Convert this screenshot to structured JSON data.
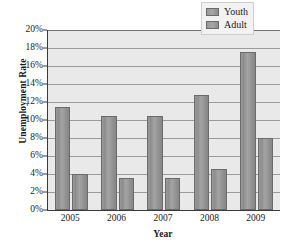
{
  "chart_data": {
    "type": "bar",
    "title": "",
    "xlabel": "Year",
    "ylabel": "Unemployment Rate",
    "categories": [
      "2005",
      "2006",
      "2007",
      "2008",
      "2009"
    ],
    "series": [
      {
        "name": "Youth",
        "values": [
          11.4,
          10.5,
          10.5,
          12.8,
          17.6
        ]
      },
      {
        "name": "Adult",
        "values": [
          4.0,
          3.6,
          3.6,
          4.6,
          8.0
        ]
      }
    ],
    "ylim": [
      0,
      20
    ],
    "ytick_values": [
      0,
      2,
      4,
      6,
      8,
      10,
      12,
      14,
      16,
      18,
      20
    ],
    "ytick_labels": [
      "0%",
      "2%",
      "4%",
      "6%",
      "8%",
      "10%",
      "12%",
      "14%",
      "16%",
      "18%",
      "20%"
    ],
    "grid": true,
    "legend_position": "top-right",
    "legend_entries": [
      "Youth",
      "Adult"
    ],
    "colors": {
      "bar_fill": "#9a9a9a",
      "bar_edge": "#6b6b6b",
      "plot_background": "#e9e9e9",
      "gridline": "#9b9b9b",
      "axis": "#3a3a3a",
      "text": "#1a1a1a",
      "legend_background": "#f2f2f2"
    }
  }
}
